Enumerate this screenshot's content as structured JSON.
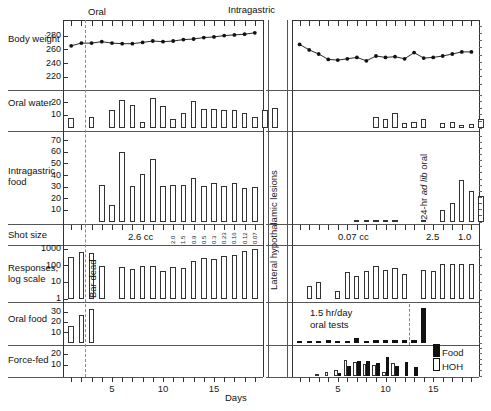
{
  "figure": {
    "xlabel": "Days",
    "section_headers": {
      "left": "Oral",
      "right": "Intragastric"
    },
    "right_side_label": "Lateral hypothalamic lesions",
    "annotations": {
      "bar_dead": "Bar dead",
      "ad_lib": "24-hr ad lib oral",
      "ad_lib_plain": "24-hr",
      "ad_lib_italic": "ad lib",
      "ad_lib_tail": "oral",
      "oral_tests_line1": "1.5 hr/day",
      "oral_tests_line2": "oral tests"
    },
    "legend": [
      {
        "key": "Food",
        "style": "solid"
      },
      {
        "key": "HOH",
        "style": "open"
      }
    ],
    "shot_size": {
      "row_label": "Shot size",
      "left_main": "2.6 cc",
      "left_series": [
        "2.0",
        "1.5",
        "0.9",
        "0.5",
        "0.3",
        "0.23",
        "0.16",
        "0.12",
        "0.07"
      ],
      "right_main": "0.07 cc",
      "right_series": [
        "2.5",
        "1.0"
      ]
    },
    "row_labels": [
      "Body weight",
      "Oral water",
      "Intragastric food",
      "Responses, log scale",
      "Oral food",
      "Force-fed"
    ],
    "xaxis": {
      "left_ticks": [
        5,
        10,
        15
      ],
      "right_ticks": [
        5,
        10,
        15
      ],
      "left_range": [
        1,
        19
      ],
      "right_range": [
        1,
        19
      ]
    }
  },
  "chart_data": [
    {
      "type": "line",
      "title": "Body weight",
      "ylabel": "Body weight",
      "ytick_labels": [
        "220",
        "240",
        "260",
        "280"
      ],
      "ylim": [
        210,
        295
      ],
      "xlabel": "Days",
      "panel": "left",
      "x": [
        1,
        2,
        3,
        4,
        5,
        6,
        7,
        8,
        9,
        10,
        11,
        12,
        13,
        14,
        15,
        16,
        17,
        18,
        19
      ],
      "values": [
        266,
        270,
        270,
        272,
        270,
        269,
        269,
        271,
        273,
        272,
        273,
        275,
        276,
        278,
        279,
        281,
        282,
        283,
        285
      ]
    },
    {
      "type": "line",
      "title": "Body weight",
      "ylabel": "Body weight",
      "ylim": [
        210,
        295
      ],
      "panel": "right",
      "x": [
        1,
        2,
        3,
        4,
        5,
        6,
        7,
        8,
        9,
        10,
        11,
        12,
        13,
        14,
        15,
        16,
        17,
        18,
        19
      ],
      "values": [
        268,
        260,
        254,
        246,
        245,
        247,
        249,
        244,
        251,
        249,
        250,
        247,
        256,
        248,
        249,
        251,
        254,
        257,
        257
      ]
    },
    {
      "type": "bar",
      "title": "Oral water",
      "ylabel": "Oral water",
      "ytick_labels": [
        "10",
        "20"
      ],
      "ylim": [
        0,
        26
      ],
      "panel": "left",
      "categories": [
        1,
        2,
        3,
        4,
        5,
        6,
        7,
        8,
        9,
        10,
        11,
        12,
        13,
        14,
        15,
        16,
        17,
        18,
        19
      ],
      "values": [
        8,
        0,
        9,
        0,
        14,
        22,
        18,
        5,
        24,
        17,
        7,
        12,
        21,
        15,
        15,
        14,
        14,
        12,
        9,
        14,
        16
      ]
    },
    {
      "type": "bar",
      "title": "Oral water",
      "ylabel": "Oral water",
      "ylim": [
        0,
        26
      ],
      "panel": "right",
      "categories": [
        1,
        2,
        3,
        4,
        5,
        6,
        7,
        8,
        9,
        10,
        11,
        12,
        13,
        14,
        15,
        16,
        17,
        18,
        19
      ],
      "values": [
        0,
        0,
        0,
        0,
        0,
        0,
        0,
        0,
        9,
        7,
        12,
        4,
        5,
        7,
        0,
        4,
        5,
        2,
        3,
        7
      ]
    },
    {
      "type": "bar",
      "title": "Intragastric food",
      "ylabel": "Intragastric food",
      "ytick_labels": [
        "10",
        "20",
        "30",
        "40",
        "50",
        "60",
        "70"
      ],
      "ylim": [
        0,
        74
      ],
      "panel": "left",
      "categories": [
        1,
        2,
        3,
        4,
        5,
        6,
        7,
        8,
        9,
        10,
        11,
        12,
        13,
        14,
        15,
        16,
        17,
        18,
        19
      ],
      "values": [
        0,
        0,
        0,
        32,
        15,
        60,
        31,
        41,
        54,
        31,
        32,
        32,
        38,
        31,
        34,
        31,
        34,
        29,
        30
      ]
    },
    {
      "type": "bar",
      "title": "Intragastric food",
      "ylabel": "Intragastric food",
      "ylim": [
        0,
        74
      ],
      "panel": "right",
      "categories": [
        1,
        2,
        3,
        4,
        5,
        6,
        7,
        8,
        9,
        10,
        11,
        12,
        13,
        14,
        15,
        16,
        17,
        18,
        19
      ],
      "values": [
        0,
        0,
        0,
        0,
        0,
        0,
        1,
        1,
        1,
        2,
        1,
        0,
        0,
        1,
        0,
        10,
        16,
        36,
        27,
        22
      ]
    },
    {
      "type": "bar",
      "title": "Responses, log scale",
      "ylabel": "Responses, log scale",
      "ytick_labels": [
        "1",
        "10",
        "100",
        "1000"
      ],
      "ylim": [
        1,
        1000
      ],
      "yscale": "log",
      "panel": "left",
      "categories": [
        1,
        2,
        3,
        4,
        5,
        6,
        7,
        8,
        9,
        10,
        11,
        12,
        13,
        14,
        15,
        16,
        17,
        18,
        19
      ],
      "values": [
        350,
        700,
        600,
        90,
        0,
        80,
        60,
        90,
        100,
        50,
        80,
        70,
        180,
        280,
        250,
        400,
        450,
        800,
        1100
      ]
    },
    {
      "type": "bar",
      "title": "Responses, log scale",
      "ylabel": "Responses, log scale",
      "ylim": [
        1,
        1000
      ],
      "yscale": "log",
      "panel": "right",
      "categories": [
        1,
        2,
        3,
        4,
        5,
        6,
        7,
        8,
        9,
        10,
        11,
        12,
        13,
        14,
        15,
        16,
        17,
        18,
        19
      ],
      "values": [
        0,
        6,
        10,
        0,
        3,
        40,
        25,
        50,
        90,
        55,
        75,
        30,
        0,
        55,
        45,
        130,
        120,
        130,
        135
      ]
    },
    {
      "type": "bar",
      "title": "Oral food",
      "ylabel": "Oral food",
      "ytick_labels": [
        "10",
        "20",
        "30"
      ],
      "ylim": [
        0,
        36
      ],
      "panel": "left",
      "categories": [
        1,
        2,
        3,
        4,
        5,
        6,
        7,
        8,
        9,
        10,
        11,
        12,
        13,
        14,
        15,
        16,
        17,
        18,
        19
      ],
      "values": [
        17,
        27,
        33,
        0,
        0,
        0,
        0,
        0,
        0,
        0,
        0,
        0,
        0,
        0,
        0,
        0,
        0,
        0,
        0
      ]
    },
    {
      "type": "bar",
      "title": "Oral food",
      "ylabel": "Oral food",
      "ylim": [
        0,
        36
      ],
      "panel": "right",
      "categories": [
        1,
        2,
        3,
        4,
        5,
        6,
        7,
        8,
        9,
        10,
        11,
        12,
        13,
        14,
        15,
        16,
        17,
        18,
        19
      ],
      "values": [
        1,
        1,
        1,
        3,
        1,
        2,
        5,
        2,
        3,
        3,
        3,
        3,
        3,
        34,
        0,
        0,
        0,
        0,
        0
      ]
    },
    {
      "type": "bar",
      "title": "Force-fed",
      "ylabel": "Force-fed",
      "ytick_labels": [
        "10",
        "20"
      ],
      "ylim": [
        0,
        26
      ],
      "panel": "left",
      "categories": [
        1,
        2,
        3,
        4,
        5,
        6,
        7,
        8,
        9,
        10,
        11,
        12,
        13,
        14,
        15,
        16,
        17,
        18,
        19
      ],
      "values": [
        0,
        0,
        0,
        0,
        0,
        0,
        0,
        0,
        0,
        0,
        0,
        0,
        0,
        0,
        0,
        0,
        0,
        0,
        0
      ]
    },
    {
      "type": "bar",
      "title": "Force-fed",
      "ylabel": "Force-fed",
      "ylim": [
        0,
        26
      ],
      "panel": "right",
      "series": [
        {
          "name": "Food",
          "values": [
            0,
            0,
            0,
            0,
            3,
            9,
            14,
            14,
            12,
            18,
            9,
            13,
            8,
            0,
            0,
            0,
            0,
            0,
            0
          ]
        },
        {
          "name": "HOH",
          "values": [
            0,
            0,
            2,
            4,
            6,
            15,
            13,
            11,
            10,
            4,
            12,
            0,
            0,
            0,
            0,
            0,
            0,
            0,
            0
          ]
        }
      ],
      "categories": [
        1,
        2,
        3,
        4,
        5,
        6,
        7,
        8,
        9,
        10,
        11,
        12,
        13,
        14,
        15,
        16,
        17,
        18,
        19
      ]
    }
  ]
}
